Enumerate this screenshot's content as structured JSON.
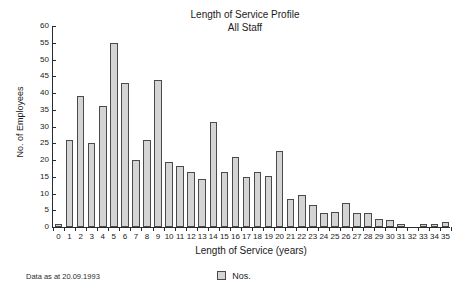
{
  "chart_data": {
    "type": "bar",
    "title": "Length of Service Profile",
    "subtitle": "All Staff",
    "xlabel": "Length of Service (years)",
    "ylabel": "No. of Employees",
    "categories": [
      "0",
      "1",
      "2",
      "3",
      "4",
      "5",
      "6",
      "7",
      "8",
      "9",
      "10",
      "11",
      "12",
      "13",
      "14",
      "15",
      "16",
      "17",
      "18",
      "19",
      "20",
      "21",
      "22",
      "23",
      "24",
      "25",
      "26",
      "27",
      "28",
      "29",
      "30",
      "31",
      "32",
      "33",
      "34",
      "35"
    ],
    "values": [
      1,
      26,
      39,
      25,
      36,
      55,
      43,
      20,
      26,
      44,
      19.3,
      18.2,
      16.5,
      14.2,
      31.2,
      16.5,
      21,
      14.8,
      16.5,
      15.3,
      22.7,
      8.3,
      9.5,
      6.5,
      4.3,
      4.4,
      7.1,
      4.3,
      4.2,
      2.5,
      2.0,
      1.0,
      0,
      1.0,
      1.0,
      1.5
    ],
    "ylim": [
      0,
      60
    ],
    "ytick_values": [
      0,
      5,
      10,
      15,
      20,
      25,
      30,
      35,
      40,
      45,
      50,
      55,
      60
    ],
    "ytick_labels": [
      "0",
      "5",
      "10",
      "15",
      "20",
      "25",
      "30",
      "35",
      "40",
      "45",
      "50",
      "55",
      "60"
    ],
    "grid": false,
    "legend": {
      "position": "bottom-center",
      "entries": [
        {
          "label": "Nos.",
          "color": "#d4d4d4",
          "border_color": "#4a4a4a"
        }
      ]
    },
    "series": [
      {
        "name": "Nos.",
        "color": "#d4d4d4",
        "values": [
          1,
          26,
          39,
          25,
          36,
          55,
          43,
          20,
          26,
          44,
          19.3,
          18.2,
          16.5,
          14.2,
          31.2,
          16.5,
          21,
          14.8,
          16.5,
          15.3,
          22.7,
          8.3,
          9.5,
          6.5,
          4.3,
          4.4,
          7.1,
          4.3,
          4.2,
          2.5,
          2.0,
          1.0,
          0,
          1.0,
          1.0,
          1.5
        ]
      }
    ],
    "annotations": [
      {
        "name": "footnote",
        "text": "Data as at 20.09.1993"
      }
    ]
  },
  "footnote": "Data as at 20.09.1993",
  "colors": {
    "bar_fill": "#d4d4d4",
    "bar_border": "#4a4a4a",
    "axis": "#2b2b2b",
    "text": "#1a1a1a",
    "background": "#ffffff"
  }
}
